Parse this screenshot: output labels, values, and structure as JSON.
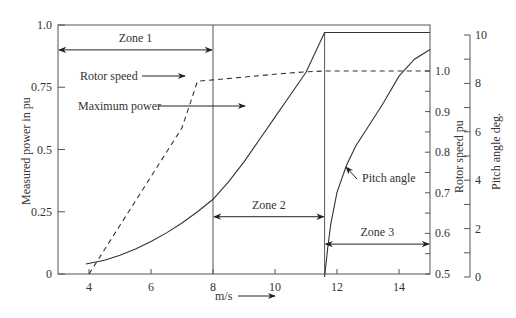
{
  "chart_data": {
    "type": "line",
    "title": "",
    "xlabel": "m/s",
    "x_ticks": [
      4,
      6,
      8,
      10,
      12,
      14
    ],
    "xlim": [
      3,
      15
    ],
    "y_axes": [
      {
        "id": "power",
        "label": "Measured power in pu",
        "ticks": [
          0,
          0.25,
          0.5,
          0.75,
          1.0
        ],
        "tick_labels": [
          "0",
          "0.25",
          "0.5",
          "0.75",
          "1.0"
        ],
        "lim": [
          0,
          1.0
        ],
        "position": "left"
      },
      {
        "id": "rotor",
        "label": "Rotor speed pu",
        "ticks": [
          0.5,
          0.6,
          0.7,
          0.8,
          0.9,
          1.0
        ],
        "tick_labels": [
          "0.5",
          "0.6",
          "0.7",
          "0.8",
          "0.9",
          "1.0"
        ],
        "lim": [
          0.5,
          1.1
        ],
        "position": "right"
      },
      {
        "id": "pitch",
        "label": "Pitch angle deg.",
        "ticks": [
          0,
          2,
          4,
          6,
          8,
          10
        ],
        "tick_labels": [
          "0",
          "2",
          "4",
          "6",
          "8",
          "10"
        ],
        "lim": [
          0,
          10
        ],
        "position": "right-outer"
      }
    ],
    "series": [
      {
        "name": "Maximum power",
        "axis": "power",
        "style": "solid",
        "x": [
          3.9,
          4.5,
          5,
          5.5,
          6,
          6.5,
          7,
          7.5,
          8,
          8.5,
          9,
          9.5,
          10,
          10.5,
          11,
          11.6,
          15
        ],
        "y": [
          0.04,
          0.055,
          0.075,
          0.1,
          0.13,
          0.165,
          0.205,
          0.25,
          0.3,
          0.37,
          0.45,
          0.54,
          0.63,
          0.72,
          0.81,
          0.97,
          0.97
        ]
      },
      {
        "name": "Rotor speed",
        "axis": "rotor",
        "style": "dashed",
        "x": [
          4.0,
          5,
          6,
          7,
          7.5,
          8,
          9,
          10,
          11,
          11.6,
          12,
          13,
          14,
          15
        ],
        "y": [
          0.5,
          0.62,
          0.74,
          0.86,
          0.975,
          0.978,
          0.985,
          0.992,
          0.998,
          1.0,
          1.0,
          1.0,
          1.0,
          1.0
        ]
      },
      {
        "name": "Pitch angle",
        "axis": "pitch",
        "style": "solid",
        "x": [
          11.6,
          11.7,
          11.8,
          12,
          12.3,
          12.6,
          13,
          13.5,
          14,
          14.5,
          15
        ],
        "y": [
          0,
          1.2,
          2.2,
          3.5,
          4.6,
          5.4,
          6.2,
          7.2,
          8.3,
          9.0,
          9.4
        ]
      }
    ],
    "zones": [
      {
        "label": "Zone 1",
        "x_start": 3,
        "x_end": 8,
        "y_power": 0.9
      },
      {
        "label": "Zone 2",
        "x_start": 8,
        "x_end": 11.6,
        "y_power": 0.23
      },
      {
        "label": "Zone 3",
        "x_start": 11.6,
        "x_end": 15,
        "y_power": 0.12
      }
    ],
    "zone_boundaries": [
      8,
      11.6
    ],
    "annotations": [
      {
        "text": "Rotor speed",
        "points_to_series": "Rotor speed"
      },
      {
        "text": "Maximum power",
        "points_to_series": "Maximum power"
      },
      {
        "text": "Pitch angle",
        "points_to_series": "Pitch angle"
      }
    ],
    "grid": false,
    "legend": "none (inline annotations)"
  },
  "labels": {
    "x_axis": "m/s",
    "y_left": "Measured power in pu",
    "y_right1": "Rotor speed pu",
    "y_right2": "Pitch angle deg.",
    "rotor_speed": "Rotor speed",
    "max_power": "Maximum power",
    "pitch_angle": "Pitch angle",
    "zone1": "Zone 1",
    "zone2": "Zone 2",
    "zone3": "Zone 3"
  }
}
